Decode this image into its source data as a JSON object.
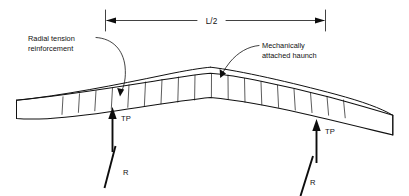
{
  "figure": {
    "background_color": "#ffffff",
    "line_color": "#111111"
  },
  "dimension": {
    "label": "L/2",
    "left_tick_x": 105,
    "right_tick_x": 325,
    "line_y": 20
  },
  "annotations": [
    {
      "id": "radial-tension-reinforcement",
      "line1": "Radial tension",
      "line2": "reinforcement",
      "text_x": 28,
      "text_y": 40,
      "leader_target_x": 120,
      "leader_target_y": 95
    },
    {
      "id": "mechanically-attached-haunch",
      "line1": "Mechanically",
      "line2": "attached haunch",
      "text_x": 262,
      "text_y": 47,
      "leader_target_x": 221,
      "leader_target_y": 79
    }
  ],
  "loads": [
    {
      "id": "tp-left",
      "label": "TP",
      "label_x": 117,
      "label_y": 121
    },
    {
      "id": "tp-right",
      "label": "TP",
      "label_x": 324,
      "label_y": 134
    },
    {
      "id": "r-left",
      "label": "R",
      "label_x": 126,
      "label_y": 174
    },
    {
      "id": "r-right",
      "label": "R",
      "label_x": 313,
      "label_y": 184
    }
  ],
  "geometry": {
    "stirrup_count": 18,
    "apex_x": 210,
    "apex_y": 68,
    "left_end_x": 16,
    "right_end_x": 393
  }
}
